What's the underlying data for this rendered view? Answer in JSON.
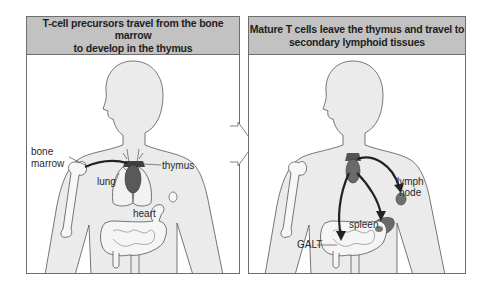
{
  "panels": [
    {
      "title_line1": "T-cell precursors travel from the bone marrow",
      "title_line2": "to develop in the thymus",
      "labels": {
        "bone_marrow_1": "bone",
        "bone_marrow_2": "marrow",
        "lung": "lung",
        "thymus": "thymus",
        "heart": "heart"
      }
    },
    {
      "title_line1": "Mature T cells leave the thymus and travel to",
      "title_line2": "secondary lymphoid tissues",
      "labels": {
        "lymph_1": "lymph",
        "lymph_2": "node",
        "spleen": "spleen",
        "galt": "GALT"
      }
    }
  ],
  "colors": {
    "header_bg": "#c2c2c2",
    "body_fill": "#ebebeb",
    "organ_dark": "#595959",
    "organ_mid": "#6f6f6f",
    "border": "#6e6e6e"
  }
}
